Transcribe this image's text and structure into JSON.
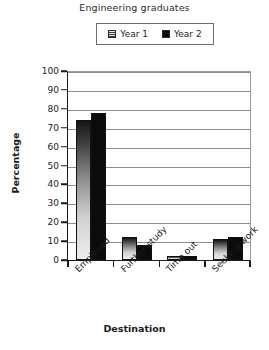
{
  "chart_data": {
    "type": "bar",
    "title": "Engineering graduates",
    "xlabel": "Destination",
    "ylabel": "Percentage",
    "categories": [
      "Employed",
      "Further study",
      "Time out",
      "Seeking work"
    ],
    "series": [
      {
        "name": "Year 1",
        "values": [
          74,
          12,
          2,
          11
        ],
        "color": "#d2d2d2",
        "fill": "hatched"
      },
      {
        "name": "Year 2",
        "values": [
          78,
          8,
          2,
          12
        ],
        "color": "#0b0b0b",
        "fill": "solid"
      }
    ],
    "ylim": [
      0,
      100
    ],
    "yticks": [
      0,
      10,
      20,
      30,
      40,
      50,
      60,
      70,
      80,
      90,
      100
    ],
    "ytick_labels": [
      "0",
      "10",
      "20",
      "30",
      "40",
      "50",
      "60",
      "70",
      "80",
      "90",
      "100"
    ],
    "grid": "horizontal",
    "legend_position": "top-center",
    "xtick_label_rotation": -45
  }
}
